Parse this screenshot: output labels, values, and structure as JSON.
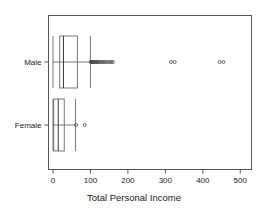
{
  "chart_data": {
    "type": "box",
    "orientation": "horizontal",
    "title": "",
    "xlabel": "Total Personal Income",
    "ylabel": "",
    "xlim": [
      -12,
      530
    ],
    "xticks": [
      0,
      100,
      200,
      300,
      400,
      500
    ],
    "xticklabels": [
      "0",
      "100",
      "200",
      "300",
      "400",
      "500"
    ],
    "categories": [
      "Male",
      "Female"
    ],
    "grid": false,
    "legend": false,
    "boxes": [
      {
        "label": "Male",
        "whisker_low": 0,
        "q1": 18,
        "median": 28,
        "q3": 65,
        "whisker_high": 100,
        "outliers": [
          101,
          102,
          103,
          104,
          105,
          107,
          109,
          112,
          115,
          118,
          120,
          124,
          128,
          132,
          136,
          140,
          145,
          150,
          155,
          160,
          315,
          325,
          445,
          455
        ]
      },
      {
        "label": "Female",
        "whisker_low": 0,
        "q1": 2,
        "median": 14,
        "q3": 30,
        "whisker_high": 60,
        "outliers": [
          62,
          85
        ]
      }
    ],
    "colors": {
      "frame": "#555555",
      "box": "#666666",
      "median": "#3a3a3a",
      "whisker": "#6a6a6a",
      "outlier": "#4a4a4a",
      "text": "#1a1a1a",
      "background": "#ffffff"
    }
  }
}
